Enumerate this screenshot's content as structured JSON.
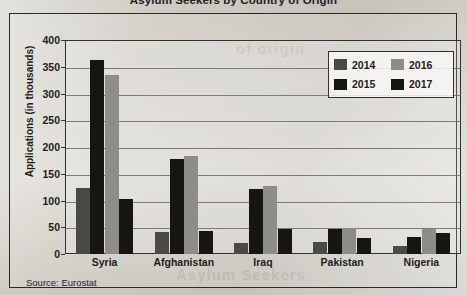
{
  "figure": {
    "title": "Asylum Seekers by Country of Origin",
    "source_note": "Source: Eurostat"
  },
  "chart_data": {
    "type": "bar",
    "title": "Asylum Seekers by Country of Origin",
    "xlabel": "",
    "ylabel": "Applications (in thousands)",
    "ylim": [
      0,
      400
    ],
    "ytick_step": 50,
    "yticks": [
      0,
      50,
      100,
      150,
      200,
      250,
      300,
      350,
      400
    ],
    "ytick_labels": [
      "0",
      "50",
      "100",
      "150",
      "200",
      "250",
      "300",
      "350",
      "400"
    ],
    "grid": true,
    "legend_position": "top-right",
    "categories": [
      "Syria",
      "Afghanistan",
      "Iraq",
      "Pakistan",
      "Nigeria"
    ],
    "series": [
      {
        "name": "2014",
        "color": "#4a4945",
        "values": [
          123,
          41,
          21,
          22,
          15
        ]
      },
      {
        "name": "2015",
        "color": "#16150f",
        "values": [
          362,
          178,
          121,
          46,
          31
        ]
      },
      {
        "name": "2016",
        "color": "#8d8c87",
        "values": [
          335,
          183,
          127,
          49,
          46
        ]
      },
      {
        "name": "2017",
        "color": "#16150f",
        "values": [
          102,
          43,
          46,
          30,
          39
        ]
      }
    ],
    "source": "Source: Eurostat"
  },
  "ghost_text": {
    "line1": "of origin",
    "line2": "Asylum Seekers"
  }
}
